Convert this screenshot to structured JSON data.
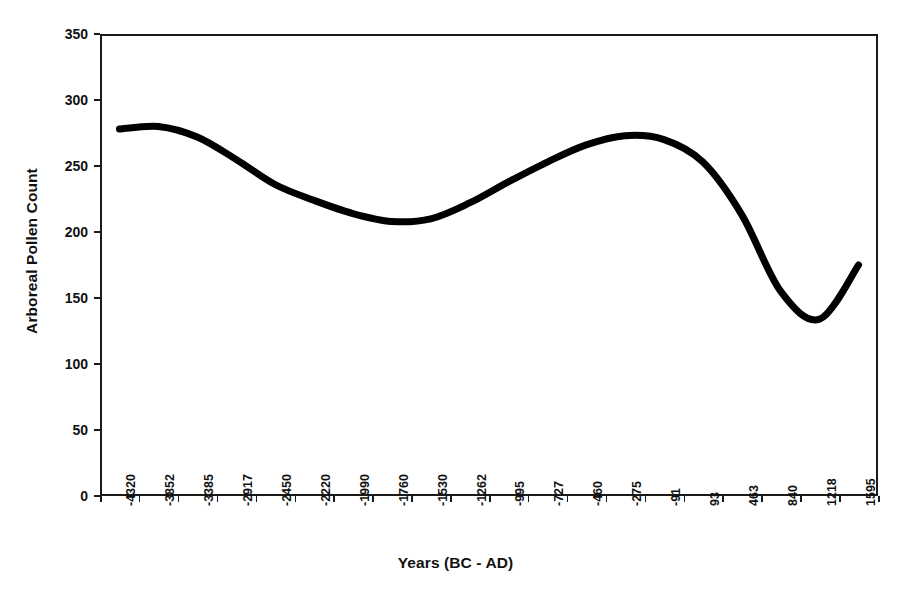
{
  "chart_data": {
    "type": "line",
    "title": "",
    "xlabel": "Years (BC - AD)",
    "ylabel": "Arboreal Pollen Count",
    "grid": false,
    "legend": false,
    "legend_position": "none",
    "line_color": "#000000",
    "line_width": 7,
    "ylim": [
      0,
      350
    ],
    "yticks": [
      0,
      50,
      100,
      150,
      200,
      250,
      300,
      350
    ],
    "ytick_labels": [
      "0",
      "50",
      "100",
      "150",
      "200",
      "250",
      "300",
      "350"
    ],
    "categories": [
      "-4320",
      "-3852",
      "-3385",
      "-2917",
      "-2450",
      "-2220",
      "-1990",
      "-1760",
      "-1530",
      "-1262",
      "-995",
      "-727",
      "-460",
      "-275",
      "-91",
      "93",
      "463",
      "840",
      "1218",
      "1595"
    ],
    "x": [
      -4320,
      -3852,
      -3385,
      -2917,
      -2450,
      -2220,
      -1990,
      -1760,
      -1530,
      -1262,
      -995,
      -727,
      -460,
      -275,
      -91,
      93,
      463,
      840,
      1218,
      1595
    ],
    "values": [
      278,
      280,
      272,
      255,
      236,
      224,
      214,
      208,
      210,
      222,
      238,
      253,
      266,
      273,
      270,
      253,
      213,
      155,
      134,
      175
    ],
    "series": [
      {
        "name": "Arboreal Pollen Count",
        "values": [
          278,
          280,
          272,
          255,
          236,
          224,
          214,
          208,
          210,
          222,
          238,
          253,
          266,
          273,
          270,
          253,
          213,
          155,
          134,
          175
        ]
      }
    ],
    "annotations": []
  }
}
